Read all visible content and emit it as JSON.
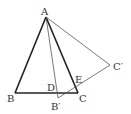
{
  "diagram": {
    "type": "geometry",
    "points": {
      "A": {
        "label": "A",
        "x": 46,
        "y": 17
      },
      "B": {
        "label": "B",
        "x": 15,
        "y": 93
      },
      "C": {
        "label": "C",
        "x": 78,
        "y": 93
      },
      "B_prime": {
        "label": "B′",
        "x": 58,
        "y": 98
      },
      "C_prime": {
        "label": "C′",
        "x": 110,
        "y": 65
      },
      "D": {
        "label": "D",
        "x": 56,
        "y": 93
      },
      "E": {
        "label": "E",
        "x": 74,
        "y": 81
      }
    },
    "segments": [
      {
        "from": "A",
        "to": "B",
        "weight": "thick"
      },
      {
        "from": "B",
        "to": "C",
        "weight": "thick"
      },
      {
        "from": "A",
        "to": "C",
        "weight": "thick"
      },
      {
        "from": "A",
        "to": "B_prime",
        "weight": "thin"
      },
      {
        "from": "B_prime",
        "to": "C_prime",
        "weight": "thin"
      },
      {
        "from": "A",
        "to": "C_prime",
        "weight": "thin"
      }
    ],
    "colors": {
      "stroke": "#222222",
      "thin_stroke": "#555555",
      "label": "#333333",
      "background": "#ffffff"
    }
  }
}
